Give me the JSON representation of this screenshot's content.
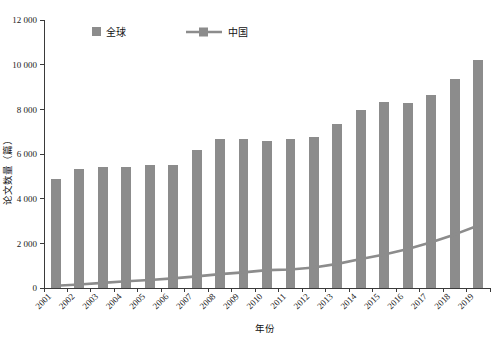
{
  "chart_data": {
    "type": "bar",
    "title": "",
    "xlabel": "年份",
    "ylabel": "论文数量（篇）",
    "categories": [
      "2001",
      "2002",
      "2003",
      "2004",
      "2005",
      "2006",
      "2007",
      "2008",
      "2009",
      "2010",
      "2011",
      "2012",
      "2013",
      "2014",
      "2015",
      "2016",
      "2017",
      "2018",
      "2019"
    ],
    "series": [
      {
        "name": "全球",
        "type": "bar",
        "color": "#8c8c8c",
        "values": [
          4900,
          5350,
          5400,
          5400,
          5500,
          5520,
          6200,
          6650,
          6650,
          6600,
          6650,
          6750,
          7350,
          7950,
          8350,
          8300,
          8650,
          9350,
          10200
        ]
      },
      {
        "name": "中国",
        "type": "line",
        "color": "#8c8c8c",
        "values": [
          100,
          160,
          230,
          300,
          360,
          430,
          520,
          620,
          700,
          800,
          830,
          920,
          1080,
          1300,
          1500,
          1750,
          2050,
          2400,
          2800
        ]
      }
    ],
    "ylim": [
      0,
      12000
    ],
    "yticks": [
      0,
      2000,
      4000,
      6000,
      8000,
      10000,
      12000
    ],
    "ytick_labels": [
      "0",
      "2 000",
      "4 000",
      "6 000",
      "8 000",
      "10 000",
      "12 000"
    ],
    "grid": false,
    "legend_position": "top-inside"
  },
  "legend": {
    "items": [
      {
        "label": "全球",
        "marker": "square-swatch"
      },
      {
        "label": "中国",
        "marker": "line-with-square-marker"
      }
    ]
  },
  "axes": {
    "x_title": "年份",
    "y_title": "论文数量（篇）"
  }
}
